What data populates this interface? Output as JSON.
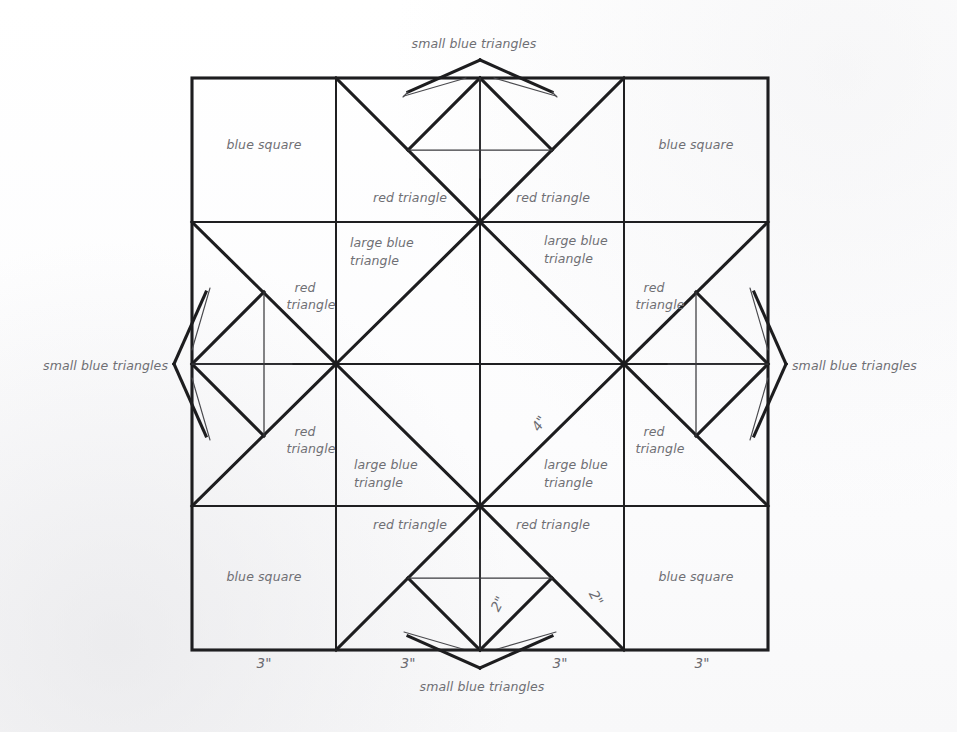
{
  "document": {
    "title": "Quilt Block Construction Diagram",
    "background_color": "#fdfdfd",
    "ink_color": "#1d1d1f",
    "label_color": "#6f6f74"
  },
  "block": {
    "outer_left": 192,
    "outer_top": 78,
    "outer_size": 576,
    "grid_divisions": 4,
    "cell_size": 144
  },
  "labels": {
    "blue_square": "blue square",
    "red_triangle": "red triangle",
    "large_blue_triangle_line1": "large blue",
    "large_blue_triangle_line2": "triangle",
    "red_triangle_line1": "red",
    "red_triangle_line2": "triangle",
    "small_blue_triangles": "small blue triangles"
  },
  "patches": {
    "corner_squares": [
      {
        "name": "blue-square-top-left",
        "text": "blue square",
        "x": 264,
        "y": 149
      },
      {
        "name": "blue-square-top-right",
        "text": "blue square",
        "x": 696,
        "y": 149
      },
      {
        "name": "blue-square-bottom-left",
        "text": "blue square",
        "x": 264,
        "y": 581
      },
      {
        "name": "blue-square-bottom-right",
        "text": "blue square",
        "x": 696,
        "y": 581
      }
    ],
    "red_triangles_single_line": [
      {
        "name": "red-triangle-top-left",
        "text": "red triangle",
        "x": 408,
        "y": 202
      },
      {
        "name": "red-triangle-top-right",
        "text": "red triangle",
        "x": 553,
        "y": 202
      },
      {
        "name": "red-triangle-bottom-left",
        "text": "red triangle",
        "x": 410,
        "y": 529
      },
      {
        "name": "red-triangle-bottom-right",
        "text": "red triangle",
        "x": 553,
        "y": 529
      }
    ],
    "red_triangles_two_line": [
      {
        "name": "red-triangle-left-upper",
        "line1": "red",
        "line2": "triangle",
        "x": 305,
        "y": 292
      },
      {
        "name": "red-triangle-left-lower",
        "line1": "red",
        "line2": "triangle",
        "x": 305,
        "y": 436
      },
      {
        "name": "red-triangle-right-upper",
        "line1": "red",
        "line2": "triangle",
        "x": 654,
        "y": 292
      },
      {
        "name": "red-triangle-right-lower",
        "line1": "red",
        "line2": "triangle",
        "x": 654,
        "y": 436
      }
    ],
    "large_blue_triangles": [
      {
        "name": "large-blue-triangle-top-left",
        "line1": "large blue",
        "line2": "triangle",
        "x": 380,
        "y": 248
      },
      {
        "name": "large-blue-triangle-top-right",
        "line1": "large blue",
        "line2": "triangle",
        "x": 574,
        "y": 248
      },
      {
        "name": "large-blue-triangle-bottom-left",
        "line1": "large blue",
        "line2": "triangle",
        "x": 388,
        "y": 471
      },
      {
        "name": "large-blue-triangle-bottom-right",
        "line1": "large blue",
        "line2": "triangle",
        "x": 574,
        "y": 471
      }
    ],
    "small_blue_triangle_callouts": [
      {
        "name": "small-blue-triangles-top",
        "text": "small blue triangles",
        "x": 474,
        "y": 48,
        "anchor": "middle"
      },
      {
        "name": "small-blue-triangles-bottom",
        "text": "small blue triangles",
        "x": 482,
        "y": 691,
        "anchor": "middle"
      },
      {
        "name": "small-blue-triangles-left",
        "text": "small blue triangles",
        "x": 168,
        "y": 370,
        "anchor": "end"
      },
      {
        "name": "small-blue-triangles-right",
        "text": "small blue triangles",
        "x": 792,
        "y": 370,
        "anchor": "start"
      }
    ]
  },
  "dimensions": {
    "bottom_segments": [
      {
        "name": "dimension-3in-segment-1",
        "text": "3\"",
        "x": 264,
        "y": 668
      },
      {
        "name": "dimension-3in-segment-2",
        "text": "3\"",
        "x": 408,
        "y": 668
      },
      {
        "name": "dimension-3in-segment-3",
        "text": "3\"",
        "x": 560,
        "y": 668
      },
      {
        "name": "dimension-3in-segment-4",
        "text": "3\"",
        "x": 702,
        "y": 668
      }
    ],
    "diagonal_labels": [
      {
        "name": "dimension-4in-center-diagonal",
        "text": "4\"",
        "x": 543,
        "y": 426,
        "rotate": -57
      },
      {
        "name": "dimension-2in-left",
        "text": "2\"",
        "x": 502,
        "y": 606,
        "rotate": -62
      },
      {
        "name": "dimension-2in-right",
        "text": "2\"",
        "x": 592,
        "y": 600,
        "rotate": 62
      }
    ]
  },
  "icons": {
    "leader_line": "leader-line-icon",
    "point_marker": "point-marker-icon"
  }
}
